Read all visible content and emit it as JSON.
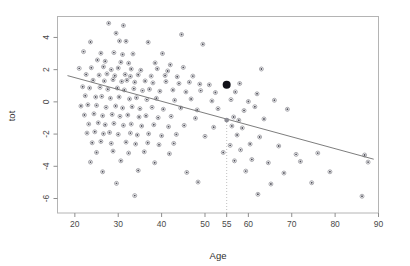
{
  "chart_data": {
    "type": "scatter",
    "title": "",
    "xlabel": "Age",
    "ylabel": "tot",
    "xlim": [
      16,
      90
    ],
    "ylim": [
      -6.9,
      5.3
    ],
    "grid": false,
    "legend": false,
    "xticks": [
      20,
      30,
      40,
      50,
      55,
      60,
      70,
      80,
      90
    ],
    "xtick_labels": [
      "20",
      "30",
      "40",
      "50",
      "55",
      "60",
      "70",
      "80",
      "90"
    ],
    "yticks": [
      4,
      2,
      0,
      -2,
      -4,
      -6
    ],
    "ytick_labels": [
      "4",
      "2",
      "0",
      "-2",
      "-4",
      "-6"
    ],
    "annotations": [
      {
        "name": "vertical-reference-line",
        "type": "vline",
        "x": 55,
        "style": "dotted",
        "y_from": -6.9,
        "y_to": -1.13
      },
      {
        "name": "highlighted-observation",
        "type": "point",
        "x": 55,
        "y": 1.07,
        "marker": "filled-circle",
        "size": "large",
        "color": "#111118"
      },
      {
        "name": "fitted-value-point",
        "type": "point",
        "x": 55,
        "y": -1.13,
        "marker": "filled-circle",
        "size": "medium",
        "color": "#8c8c94"
      }
    ],
    "fit_line": {
      "name": "regression-line",
      "type": "line",
      "x": [
        18.3,
        88.9
      ],
      "y": [
        1.63,
        -3.56
      ],
      "slope": -0.0736,
      "intercept": 2.98
    },
    "points": [
      {
        "x": 27.8,
        "y": 4.88
      },
      {
        "x": 31.2,
        "y": 4.74
      },
      {
        "x": 29.5,
        "y": 4.26
      },
      {
        "x": 44.6,
        "y": 4.18
      },
      {
        "x": 23.6,
        "y": 3.72
      },
      {
        "x": 30.3,
        "y": 3.78
      },
      {
        "x": 31.8,
        "y": 3.76
      },
      {
        "x": 36.9,
        "y": 3.7
      },
      {
        "x": 49.5,
        "y": 3.58
      },
      {
        "x": 22.0,
        "y": 3.12
      },
      {
        "x": 26.0,
        "y": 3.02
      },
      {
        "x": 29.0,
        "y": 3.06
      },
      {
        "x": 31.0,
        "y": 2.94
      },
      {
        "x": 33.4,
        "y": 2.98
      },
      {
        "x": 40.2,
        "y": 3.0
      },
      {
        "x": 25.2,
        "y": 2.6
      },
      {
        "x": 27.0,
        "y": 2.52
      },
      {
        "x": 30.6,
        "y": 2.46
      },
      {
        "x": 32.4,
        "y": 2.4
      },
      {
        "x": 38.5,
        "y": 2.42
      },
      {
        "x": 42.0,
        "y": 2.3
      },
      {
        "x": 21.0,
        "y": 2.08
      },
      {
        "x": 23.8,
        "y": 2.12
      },
      {
        "x": 26.6,
        "y": 2.18
      },
      {
        "x": 28.4,
        "y": 2.0
      },
      {
        "x": 30.0,
        "y": 2.1
      },
      {
        "x": 33.0,
        "y": 2.04
      },
      {
        "x": 35.2,
        "y": 1.96
      },
      {
        "x": 39.0,
        "y": 2.06
      },
      {
        "x": 41.4,
        "y": 1.92
      },
      {
        "x": 45.0,
        "y": 2.14
      },
      {
        "x": 63.0,
        "y": 2.04
      },
      {
        "x": 22.6,
        "y": 1.7
      },
      {
        "x": 25.6,
        "y": 1.66
      },
      {
        "x": 27.4,
        "y": 1.74
      },
      {
        "x": 29.2,
        "y": 1.62
      },
      {
        "x": 31.6,
        "y": 1.7
      },
      {
        "x": 32.8,
        "y": 1.58
      },
      {
        "x": 34.6,
        "y": 1.68
      },
      {
        "x": 37.6,
        "y": 1.6
      },
      {
        "x": 40.8,
        "y": 1.64
      },
      {
        "x": 43.6,
        "y": 1.56
      },
      {
        "x": 47.2,
        "y": 1.6
      },
      {
        "x": 51.0,
        "y": 1.06
      },
      {
        "x": 24.2,
        "y": 1.34
      },
      {
        "x": 26.8,
        "y": 1.3
      },
      {
        "x": 28.8,
        "y": 1.38
      },
      {
        "x": 30.8,
        "y": 1.26
      },
      {
        "x": 32.0,
        "y": 1.34
      },
      {
        "x": 33.8,
        "y": 1.22
      },
      {
        "x": 36.2,
        "y": 1.3
      },
      {
        "x": 38.0,
        "y": 1.18
      },
      {
        "x": 41.0,
        "y": 1.26
      },
      {
        "x": 44.0,
        "y": 1.14
      },
      {
        "x": 46.4,
        "y": 1.22
      },
      {
        "x": 48.8,
        "y": 1.1
      },
      {
        "x": 58.0,
        "y": 1.14
      },
      {
        "x": 21.8,
        "y": 0.94
      },
      {
        "x": 23.4,
        "y": 0.86
      },
      {
        "x": 25.8,
        "y": 0.9
      },
      {
        "x": 27.6,
        "y": 0.78
      },
      {
        "x": 29.8,
        "y": 0.86
      },
      {
        "x": 31.4,
        "y": 0.74
      },
      {
        "x": 33.6,
        "y": 0.82
      },
      {
        "x": 35.6,
        "y": 0.7
      },
      {
        "x": 37.2,
        "y": 0.78
      },
      {
        "x": 39.6,
        "y": 0.66
      },
      {
        "x": 42.6,
        "y": 0.74
      },
      {
        "x": 45.6,
        "y": 0.62
      },
      {
        "x": 49.0,
        "y": 0.7
      },
      {
        "x": 52.4,
        "y": 0.58
      },
      {
        "x": 57.0,
        "y": 0.62
      },
      {
        "x": 62.0,
        "y": 0.5
      },
      {
        "x": 22.4,
        "y": 0.38
      },
      {
        "x": 24.8,
        "y": 0.3
      },
      {
        "x": 26.2,
        "y": 0.34
      },
      {
        "x": 28.2,
        "y": 0.22
      },
      {
        "x": 30.2,
        "y": 0.3
      },
      {
        "x": 32.6,
        "y": 0.18
      },
      {
        "x": 34.2,
        "y": 0.26
      },
      {
        "x": 36.6,
        "y": 0.14
      },
      {
        "x": 38.8,
        "y": 0.22
      },
      {
        "x": 43.0,
        "y": 0.1
      },
      {
        "x": 46.8,
        "y": 0.18
      },
      {
        "x": 51.6,
        "y": 0.06
      },
      {
        "x": 56.0,
        "y": 0.14
      },
      {
        "x": 60.0,
        "y": 0.02
      },
      {
        "x": 66.0,
        "y": 0.1
      },
      {
        "x": 21.4,
        "y": -0.26
      },
      {
        "x": 23.0,
        "y": -0.18
      },
      {
        "x": 25.0,
        "y": -0.22
      },
      {
        "x": 27.2,
        "y": -0.34
      },
      {
        "x": 29.4,
        "y": -0.26
      },
      {
        "x": 31.0,
        "y": -0.38
      },
      {
        "x": 33.2,
        "y": -0.3
      },
      {
        "x": 35.0,
        "y": -0.42
      },
      {
        "x": 37.8,
        "y": -0.34
      },
      {
        "x": 40.4,
        "y": -0.46
      },
      {
        "x": 44.4,
        "y": -0.38
      },
      {
        "x": 48.2,
        "y": -0.5
      },
      {
        "x": 53.0,
        "y": -0.42
      },
      {
        "x": 59.0,
        "y": -0.54
      },
      {
        "x": 61.5,
        "y": -0.3
      },
      {
        "x": 69.0,
        "y": -0.46
      },
      {
        "x": 22.2,
        "y": -0.82
      },
      {
        "x": 24.4,
        "y": -0.74
      },
      {
        "x": 26.4,
        "y": -0.86
      },
      {
        "x": 28.6,
        "y": -0.78
      },
      {
        "x": 30.4,
        "y": -0.9
      },
      {
        "x": 32.2,
        "y": -0.82
      },
      {
        "x": 34.8,
        "y": -0.94
      },
      {
        "x": 36.4,
        "y": -0.86
      },
      {
        "x": 39.2,
        "y": -0.98
      },
      {
        "x": 42.2,
        "y": -0.9
      },
      {
        "x": 47.8,
        "y": -1.02
      },
      {
        "x": 56.6,
        "y": -0.94
      },
      {
        "x": 57.8,
        "y": -1.14
      },
      {
        "x": 63.6,
        "y": -1.06
      },
      {
        "x": 23.2,
        "y": -1.38
      },
      {
        "x": 25.4,
        "y": -1.3
      },
      {
        "x": 27.0,
        "y": -1.42
      },
      {
        "x": 29.0,
        "y": -1.34
      },
      {
        "x": 31.2,
        "y": -1.46
      },
      {
        "x": 33.0,
        "y": -1.38
      },
      {
        "x": 35.4,
        "y": -1.5
      },
      {
        "x": 38.2,
        "y": -1.42
      },
      {
        "x": 41.6,
        "y": -1.54
      },
      {
        "x": 45.2,
        "y": -1.46
      },
      {
        "x": 52.0,
        "y": -1.58
      },
      {
        "x": 56.2,
        "y": -1.5
      },
      {
        "x": 58.6,
        "y": -1.62
      },
      {
        "x": 22.8,
        "y": -1.94
      },
      {
        "x": 24.6,
        "y": -1.86
      },
      {
        "x": 26.6,
        "y": -1.98
      },
      {
        "x": 28.0,
        "y": -1.9
      },
      {
        "x": 30.0,
        "y": -2.02
      },
      {
        "x": 32.8,
        "y": -1.94
      },
      {
        "x": 34.4,
        "y": -2.06
      },
      {
        "x": 37.0,
        "y": -1.98
      },
      {
        "x": 40.0,
        "y": -2.1
      },
      {
        "x": 43.4,
        "y": -2.02
      },
      {
        "x": 50.0,
        "y": -2.14
      },
      {
        "x": 57.4,
        "y": -2.06
      },
      {
        "x": 62.6,
        "y": -2.18
      },
      {
        "x": 24.0,
        "y": -2.54
      },
      {
        "x": 26.0,
        "y": -2.46
      },
      {
        "x": 28.4,
        "y": -2.58
      },
      {
        "x": 31.8,
        "y": -2.5
      },
      {
        "x": 34.0,
        "y": -2.62
      },
      {
        "x": 36.8,
        "y": -2.54
      },
      {
        "x": 39.4,
        "y": -2.66
      },
      {
        "x": 42.8,
        "y": -2.58
      },
      {
        "x": 55.8,
        "y": -2.7
      },
      {
        "x": 60.4,
        "y": -2.62
      },
      {
        "x": 67.0,
        "y": -2.74
      },
      {
        "x": 25.0,
        "y": -3.14
      },
      {
        "x": 28.8,
        "y": -3.06
      },
      {
        "x": 32.4,
        "y": -3.18
      },
      {
        "x": 36.0,
        "y": -3.1
      },
      {
        "x": 41.8,
        "y": -3.22
      },
      {
        "x": 54.2,
        "y": -3.14
      },
      {
        "x": 58.2,
        "y": -2.98
      },
      {
        "x": 71.0,
        "y": -3.26
      },
      {
        "x": 76.0,
        "y": -3.18
      },
      {
        "x": 86.8,
        "y": -3.3
      },
      {
        "x": 23.6,
        "y": -3.74
      },
      {
        "x": 30.6,
        "y": -3.66
      },
      {
        "x": 38.4,
        "y": -3.78
      },
      {
        "x": 56.8,
        "y": -3.66
      },
      {
        "x": 60.8,
        "y": -3.58
      },
      {
        "x": 64.6,
        "y": -3.78
      },
      {
        "x": 72.0,
        "y": -3.7
      },
      {
        "x": 87.6,
        "y": -3.74
      },
      {
        "x": 26.4,
        "y": -4.34
      },
      {
        "x": 34.6,
        "y": -4.26
      },
      {
        "x": 45.8,
        "y": -4.38
      },
      {
        "x": 59.4,
        "y": -4.3
      },
      {
        "x": 68.2,
        "y": -4.42
      },
      {
        "x": 78.8,
        "y": -4.34
      },
      {
        "x": 29.6,
        "y": -5.06
      },
      {
        "x": 48.4,
        "y": -4.98
      },
      {
        "x": 65.2,
        "y": -5.1
      },
      {
        "x": 74.6,
        "y": -5.02
      },
      {
        "x": 33.8,
        "y": -5.82
      },
      {
        "x": 62.2,
        "y": -5.74
      },
      {
        "x": 86.2,
        "y": -5.86
      }
    ]
  }
}
